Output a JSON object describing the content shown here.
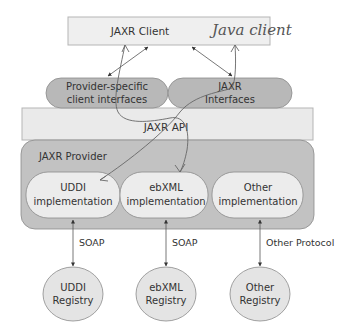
{
  "colors": {
    "background": "#ffffff",
    "client_fill": "#efefef",
    "client_stroke": "#b5b5b5",
    "pill_fill": "#b8b8b8",
    "api_fill": "#eaeaea",
    "provider_fill": "#c2c2c2",
    "impl_fill": "#ececec",
    "registry_fill": "#e4e4e4",
    "stroke": "#8a8a8a",
    "text": "#333333",
    "handwriting": "#5a5a5a"
  },
  "client": {
    "label": "JAXR Client",
    "annotation": "Java client"
  },
  "interfaces": [
    {
      "line1": "Provider-specific",
      "line2": "client interfaces"
    },
    {
      "line1": "JAXR",
      "line2": "Interfaces"
    }
  ],
  "api": {
    "label": "JAXR API"
  },
  "provider": {
    "label": "JAXR Provider",
    "implementations": [
      {
        "line1": "UDDI",
        "line2": "implementation"
      },
      {
        "line1": "ebXML",
        "line2": "implementation"
      },
      {
        "line1": "Other",
        "line2": "implementation"
      }
    ]
  },
  "protocols": [
    "SOAP",
    "SOAP",
    "Other Protocol"
  ],
  "registries": [
    {
      "line1": "UDDI",
      "line2": "Registry"
    },
    {
      "line1": "ebXML",
      "line2": "Registry"
    },
    {
      "line1": "Other",
      "line2": "Registry"
    }
  ]
}
